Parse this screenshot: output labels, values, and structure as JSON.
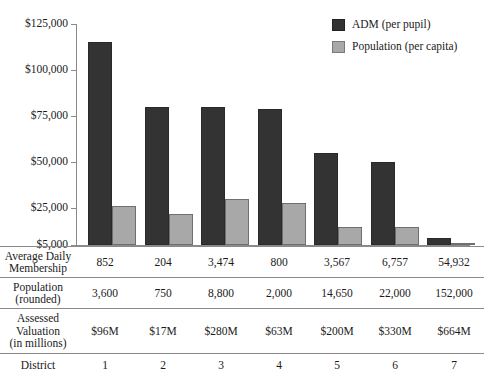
{
  "chart_data": {
    "type": "bar",
    "title": "",
    "xlabel": "District",
    "ylabel": "",
    "ylim": [
      5000,
      125000
    ],
    "grid": false,
    "legend_position": "top-right",
    "categories": [
      "1",
      "2",
      "3",
      "4",
      "5",
      "6",
      "7"
    ],
    "ytick_labels": [
      "$125,000",
      "$100,000",
      "$75,000",
      "$50,000",
      "$25,000",
      "$5,000"
    ],
    "ytick_values": [
      125000,
      100000,
      75000,
      50000,
      25000,
      5000
    ],
    "series": [
      {
        "name": "ADM (per pupil)",
        "color": "#333333",
        "values": [
          115000,
          80000,
          80000,
          79000,
          55000,
          50000,
          9000
        ]
      },
      {
        "name": "Population (per capita)",
        "color": "#a8a8a8",
        "values": [
          26000,
          22000,
          30000,
          28000,
          15000,
          15000,
          5500
        ]
      }
    ],
    "table": {
      "rows": [
        {
          "label": "Average Daily\nMembership",
          "label_lines": [
            "Average Daily",
            "Membership"
          ],
          "values": [
            "852",
            "204",
            "3,474",
            "800",
            "3,567",
            "6,757",
            "54,932"
          ]
        },
        {
          "label": "Population\n(rounded)",
          "label_lines": [
            "Population",
            "(rounded)"
          ],
          "values": [
            "3,600",
            "750",
            "8,800",
            "2,000",
            "14,650",
            "22,000",
            "152,000"
          ]
        },
        {
          "label": "Assessed\nValuation\n(in millions)",
          "label_lines": [
            "Assessed",
            "Valuation",
            "(in millions)"
          ],
          "values": [
            "$96M",
            "$17M",
            "$280M",
            "$63M",
            "$200M",
            "$330M",
            "$664M"
          ]
        },
        {
          "label": "District",
          "label_lines": [
            "District"
          ],
          "values": [
            "1",
            "2",
            "3",
            "4",
            "5",
            "6",
            "7"
          ]
        }
      ]
    }
  },
  "legend": {
    "items": [
      {
        "label": "ADM (per pupil)",
        "color": "#333333"
      },
      {
        "label": "Population (per capita)",
        "color": "#a8a8a8"
      }
    ]
  },
  "axis": {
    "labels": [
      "$125,000",
      "$100,000",
      "$75,000",
      "$50,000",
      "$25,000",
      "$5,000"
    ]
  }
}
